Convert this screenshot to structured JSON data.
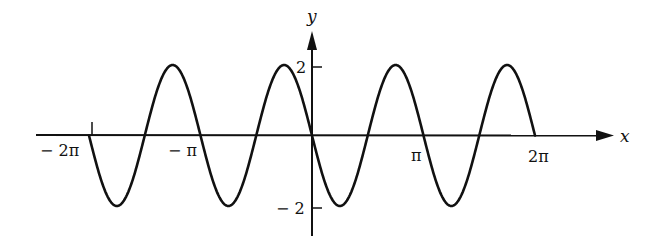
{
  "chart_data": {
    "type": "line",
    "title": "",
    "function": "y = -2 sin(2x)",
    "xlabel": "x",
    "ylabel": "y",
    "xlim": [
      -6.2832,
      6.2832
    ],
    "ylim": [
      -2,
      2
    ],
    "x_ticks": [
      {
        "value": -6.2832,
        "label": "− 2π"
      },
      {
        "value": -3.1416,
        "label": "− π"
      },
      {
        "value": 3.1416,
        "label": "π"
      },
      {
        "value": 6.2832,
        "label": "2π"
      }
    ],
    "y_ticks": [
      {
        "value": 2,
        "label": "2"
      },
      {
        "value": -2,
        "label": "− 2"
      }
    ],
    "grid": false,
    "legend": null,
    "series": [
      {
        "name": "y = -2 sin(2x)",
        "amplitude": 2,
        "period": 3.1416,
        "x": [
          -6.2832,
          -5.4978,
          -4.7124,
          -3.927,
          -3.1416,
          -2.3562,
          -1.5708,
          -0.7854,
          0,
          0.7854,
          1.5708,
          2.3562,
          3.1416,
          3.927,
          4.7124,
          5.4978,
          6.2832
        ],
        "values": [
          0,
          -2,
          0,
          2,
          0,
          -2,
          0,
          2,
          0,
          -2,
          0,
          2,
          0,
          -2,
          0,
          2,
          0
        ]
      }
    ],
    "colors": {
      "line": "#111111",
      "axes": "#111111",
      "background": "#ffffff"
    }
  }
}
